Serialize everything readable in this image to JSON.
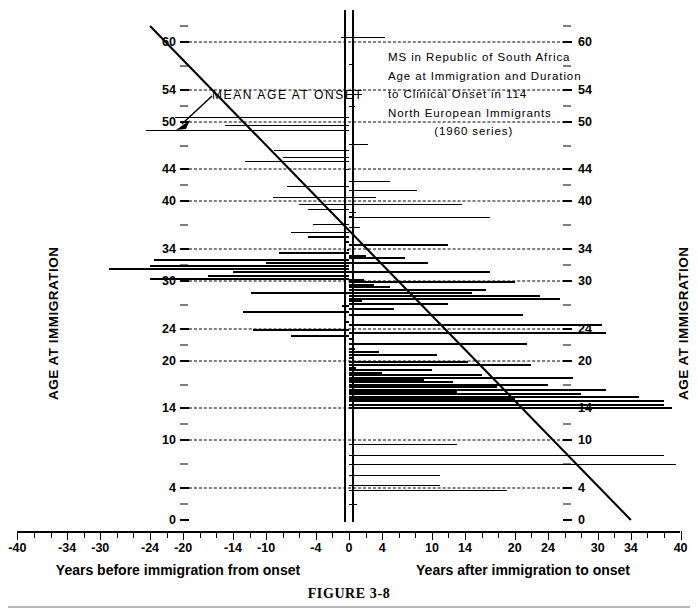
{
  "figure": {
    "caption": "FIGURE 3-8"
  },
  "titleblock": {
    "lines": [
      "MS in Republic of South Africa",
      "Age at Immigration and Duration",
      "to Clinical Onset in 114",
      "North European Immigrants"
    ],
    "series_line": "(1960 series)"
  },
  "annotation": {
    "mean_age_at_onset": "MEAN AGE AT ONSET"
  },
  "axes": {
    "y_label_left": "AGE AT IMMIGRATION",
    "y_label_right": "AGE AT IMMIGRATION",
    "y_ticks": [
      0,
      4,
      10,
      14,
      20,
      24,
      30,
      34,
      40,
      44,
      50,
      54,
      60
    ],
    "y_minor_ticks": [
      2,
      7,
      12,
      17,
      22,
      27,
      32,
      37,
      42,
      47,
      52,
      57,
      62
    ],
    "y_min": 0,
    "y_max": 62,
    "x_ticks": [
      -40,
      -34,
      -30,
      -24,
      -20,
      -14,
      -10,
      -4,
      0,
      4,
      10,
      14,
      20,
      24,
      30,
      34,
      40
    ],
    "x_tick_labels": [
      "-40",
      "-34",
      "-30",
      "-24",
      "-20",
      "-14",
      "-10",
      "-4",
      "0",
      "4",
      "10",
      "14",
      "20",
      "24",
      "30",
      "34",
      "40"
    ],
    "x_minor_ticks": [
      -38,
      -36,
      -32,
      -28,
      -26,
      -22,
      -18,
      -16,
      -12,
      -8,
      -6,
      -2,
      2,
      6,
      8,
      12,
      16,
      18,
      22,
      26,
      28,
      32,
      36,
      38
    ],
    "x_min": -40,
    "x_max": 40,
    "x_caption_left": "Years before immigration from onset",
    "x_caption_right": "Years after immigration to onset"
  },
  "chart_data": {
    "type": "bar",
    "orientation": "horizontal",
    "xlabel": "Years before immigration from onset  /  Years after immigration to onset",
    "ylabel": "AGE AT IMMIGRATION",
    "xlim": [
      -40,
      40
    ],
    "ylim": [
      0,
      62
    ],
    "grid": true,
    "grid_axis": "y",
    "legend": "none",
    "n_cases": 114,
    "note": "Each horizontal bar is one immigrant case: bar spans from the zero axis (age at immigration) out to the interval in years between immigration and clinical onset. Bars to the right of zero = onset after immigration; bars to the left of zero = onset before immigration.",
    "mean_age_at_onset_line": {
      "description": "Diagonal regression line labelled MEAN AGE AT ONSET",
      "point_a": {
        "x": -24,
        "y": 62
      },
      "point_b": {
        "x": 34,
        "y": 0
      }
    },
    "cases": [
      {
        "age": 60.6,
        "years": 4.3,
        "side": "right"
      },
      {
        "age": 60.6,
        "years": -1.0,
        "side": "left"
      },
      {
        "age": 57.2,
        "years": 0.6,
        "side": "right"
      },
      {
        "age": 53.5,
        "years": 1.6,
        "side": "right"
      },
      {
        "age": 52.0,
        "years": 0.7,
        "side": "right"
      },
      {
        "age": 50.6,
        "years": -21.0,
        "side": "left"
      },
      {
        "age": 49.6,
        "years": -15.0,
        "side": "left"
      },
      {
        "age": 49.0,
        "years": -24.5,
        "side": "left"
      },
      {
        "age": 47.2,
        "years": 2.3,
        "side": "right"
      },
      {
        "age": 46.4,
        "years": -9.0,
        "side": "left"
      },
      {
        "age": 45.6,
        "years": -8.0,
        "side": "left"
      },
      {
        "age": 45.0,
        "years": -12.5,
        "side": "left"
      },
      {
        "age": 44.0,
        "years": -0.4,
        "side": "left"
      },
      {
        "age": 42.6,
        "years": 5.0,
        "side": "right"
      },
      {
        "age": 41.9,
        "years": -7.5,
        "side": "left"
      },
      {
        "age": 41.4,
        "years": 8.2,
        "side": "right"
      },
      {
        "age": 40.5,
        "years": -9.2,
        "side": "left"
      },
      {
        "age": 40.5,
        "years": 3.2,
        "side": "right"
      },
      {
        "age": 39.7,
        "years": -6.0,
        "side": "left"
      },
      {
        "age": 39.7,
        "years": 13.6,
        "side": "right"
      },
      {
        "age": 39.0,
        "years": -5.0,
        "side": "left"
      },
      {
        "age": 38.6,
        "years": 0.8,
        "side": "right"
      },
      {
        "age": 38.2,
        "years": 0.6,
        "side": "right"
      },
      {
        "age": 38.0,
        "years": 17.0,
        "side": "right"
      },
      {
        "age": 37.2,
        "years": -4.3,
        "side": "left"
      },
      {
        "age": 36.8,
        "years": 1.3,
        "side": "right"
      },
      {
        "age": 36.2,
        "years": -7.0,
        "side": "left"
      },
      {
        "age": 35.6,
        "years": -5.0,
        "side": "left"
      },
      {
        "age": 35.0,
        "years": -0.6,
        "side": "left"
      },
      {
        "age": 34.6,
        "years": 12.0,
        "side": "right"
      },
      {
        "age": 34.0,
        "years": -0.3,
        "side": "left"
      },
      {
        "age": 33.6,
        "years": -8.4,
        "side": "left"
      },
      {
        "age": 33.3,
        "years": 2.0,
        "side": "right"
      },
      {
        "age": 33.0,
        "years": 6.8,
        "side": "right"
      },
      {
        "age": 32.7,
        "years": -23.5,
        "side": "left"
      },
      {
        "age": 32.4,
        "years": -10.0,
        "side": "left"
      },
      {
        "age": 32.4,
        "years": 9.5,
        "side": "right"
      },
      {
        "age": 32.0,
        "years": -24.0,
        "side": "left"
      },
      {
        "age": 31.6,
        "years": -29.0,
        "side": "left"
      },
      {
        "age": 31.2,
        "years": -14.0,
        "side": "left"
      },
      {
        "age": 31.2,
        "years": 17.0,
        "side": "right"
      },
      {
        "age": 30.8,
        "years": -17.0,
        "side": "left"
      },
      {
        "age": 30.4,
        "years": -24.0,
        "side": "left"
      },
      {
        "age": 30.2,
        "years": 1.8,
        "side": "right"
      },
      {
        "age": 30.0,
        "years": 20.0,
        "side": "right"
      },
      {
        "age": 29.6,
        "years": 3.0,
        "side": "right"
      },
      {
        "age": 29.4,
        "years": 5.0,
        "side": "right"
      },
      {
        "age": 29.0,
        "years": 16.5,
        "side": "right"
      },
      {
        "age": 28.6,
        "years": -11.8,
        "side": "left"
      },
      {
        "age": 28.6,
        "years": 14.8,
        "side": "right"
      },
      {
        "age": 28.2,
        "years": 23.0,
        "side": "right"
      },
      {
        "age": 27.9,
        "years": 25.4,
        "side": "right"
      },
      {
        "age": 27.6,
        "years": 1.6,
        "side": "right"
      },
      {
        "age": 27.3,
        "years": 12.0,
        "side": "right"
      },
      {
        "age": 27.0,
        "years": -0.8,
        "side": "left"
      },
      {
        "age": 26.6,
        "years": 5.4,
        "side": "right"
      },
      {
        "age": 26.2,
        "years": -12.8,
        "side": "left"
      },
      {
        "age": 25.8,
        "years": 21.0,
        "side": "right"
      },
      {
        "age": 25.0,
        "years": -0.5,
        "side": "left"
      },
      {
        "age": 24.6,
        "years": 30.5,
        "side": "right"
      },
      {
        "age": 24.0,
        "years": -11.6,
        "side": "left"
      },
      {
        "age": 23.6,
        "years": 31.0,
        "side": "right"
      },
      {
        "age": 23.2,
        "years": -7.0,
        "side": "left"
      },
      {
        "age": 22.8,
        "years": 0.4,
        "side": "right"
      },
      {
        "age": 22.2,
        "years": 21.5,
        "side": "right"
      },
      {
        "age": 21.6,
        "years": 0.7,
        "side": "right"
      },
      {
        "age": 21.2,
        "years": 3.6,
        "side": "right"
      },
      {
        "age": 20.8,
        "years": 10.6,
        "side": "right"
      },
      {
        "age": 20.4,
        "years": 0.5,
        "side": "right"
      },
      {
        "age": 20.0,
        "years": 14.4,
        "side": "right"
      },
      {
        "age": 19.6,
        "years": 22.0,
        "side": "right"
      },
      {
        "age": 19.2,
        "years": 0.8,
        "side": "right"
      },
      {
        "age": 18.9,
        "years": 10.0,
        "side": "right"
      },
      {
        "age": 18.6,
        "years": 4.0,
        "side": "right"
      },
      {
        "age": 18.3,
        "years": 16.0,
        "side": "right"
      },
      {
        "age": 18.0,
        "years": 27.0,
        "side": "right"
      },
      {
        "age": 17.7,
        "years": 9.0,
        "side": "right"
      },
      {
        "age": 17.4,
        "years": 12.5,
        "side": "right"
      },
      {
        "age": 17.1,
        "years": 24.0,
        "side": "right"
      },
      {
        "age": 16.8,
        "years": 17.8,
        "side": "right"
      },
      {
        "age": 16.5,
        "years": 31.0,
        "side": "right"
      },
      {
        "age": 16.2,
        "years": 13.0,
        "side": "right"
      },
      {
        "age": 15.9,
        "years": 28.0,
        "side": "right"
      },
      {
        "age": 15.6,
        "years": 35.0,
        "side": "right"
      },
      {
        "age": 15.3,
        "years": 20.0,
        "side": "right"
      },
      {
        "age": 15.0,
        "years": 38.0,
        "side": "right"
      },
      {
        "age": 14.6,
        "years": 38.0,
        "side": "right"
      },
      {
        "age": 14.2,
        "years": 39.0,
        "side": "right"
      },
      {
        "age": 9.6,
        "years": 13.0,
        "side": "right"
      },
      {
        "age": 8.2,
        "years": 38.0,
        "side": "right"
      },
      {
        "age": 7.0,
        "years": 39.5,
        "side": "right"
      },
      {
        "age": 5.6,
        "years": 11.0,
        "side": "right"
      },
      {
        "age": 4.4,
        "years": 11.0,
        "side": "right"
      },
      {
        "age": 3.8,
        "years": 19.0,
        "side": "right"
      },
      {
        "age": 2.0,
        "years": 1.0,
        "side": "right"
      }
    ]
  }
}
